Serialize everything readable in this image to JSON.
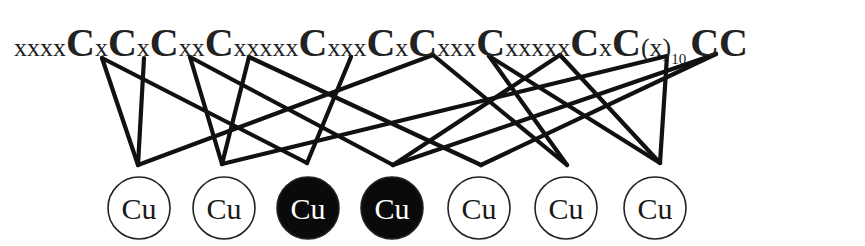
{
  "sequence": {
    "segments": [
      {
        "type": "spacer",
        "text": "xxxx"
      },
      {
        "type": "cys",
        "text": "C",
        "id": "C1"
      },
      {
        "type": "spacer",
        "text": "x"
      },
      {
        "type": "cys",
        "text": "C",
        "id": "C2"
      },
      {
        "type": "spacer",
        "text": "x"
      },
      {
        "type": "cys",
        "text": "C",
        "id": "C3"
      },
      {
        "type": "spacer",
        "text": "xx"
      },
      {
        "type": "cys",
        "text": "C",
        "id": "C4"
      },
      {
        "type": "spacer",
        "text": "xxxxx"
      },
      {
        "type": "cys",
        "text": "C",
        "id": "C5"
      },
      {
        "type": "spacer",
        "text": "xxx"
      },
      {
        "type": "cys",
        "text": "C",
        "id": "C6"
      },
      {
        "type": "spacer",
        "text": "x"
      },
      {
        "type": "cys",
        "text": "C",
        "id": "C7"
      },
      {
        "type": "spacer",
        "text": "xxx"
      },
      {
        "type": "cys",
        "text": "C",
        "id": "C8"
      },
      {
        "type": "spacer",
        "text": "xxxxx"
      },
      {
        "type": "cys",
        "text": "C",
        "id": "C9"
      },
      {
        "type": "spacer",
        "text": "x"
      },
      {
        "type": "cys",
        "text": "C",
        "id": "C10"
      },
      {
        "type": "spacer",
        "text": "(x)"
      },
      {
        "type": "subscript",
        "text": "10"
      },
      {
        "type": "cys",
        "text": "CC",
        "id": "C11-C12"
      }
    ]
  },
  "copper_ions": [
    {
      "id": "Cu1",
      "label": "Cu",
      "filled": false,
      "cx": 139,
      "cy": 208
    },
    {
      "id": "Cu2",
      "label": "Cu",
      "filled": false,
      "cx": 224,
      "cy": 208
    },
    {
      "id": "Cu3",
      "label": "Cu",
      "filled": true,
      "cx": 308,
      "cy": 208
    },
    {
      "id": "Cu4",
      "label": "Cu",
      "filled": true,
      "cx": 392,
      "cy": 208
    },
    {
      "id": "Cu5",
      "label": "Cu",
      "filled": false,
      "cx": 479,
      "cy": 208
    },
    {
      "id": "Cu6",
      "label": "Cu",
      "filled": false,
      "cx": 566,
      "cy": 208
    },
    {
      "id": "Cu7",
      "label": "Cu",
      "filled": false,
      "cx": 655,
      "cy": 208
    }
  ],
  "cysteine_anchors": {
    "C1": [
      102,
      58
    ],
    "C2": [
      144,
      58
    ],
    "C3": [
      190,
      57
    ],
    "C4": [
      249,
      57
    ],
    "C5": [
      351,
      57
    ],
    "C6": [
      433,
      55
    ],
    "C7": [
      489,
      56
    ],
    "C8": [
      560,
      55
    ],
    "C9": [
      667,
      56
    ],
    "C10": [
      716,
      54
    ]
  },
  "copper_anchors": {
    "Cu1": [
      138,
      165
    ],
    "Cu2": [
      222,
      164
    ],
    "Cu3": [
      307,
      163
    ],
    "Cu4": [
      393,
      165
    ],
    "Cu5": [
      481,
      165
    ],
    "Cu6": [
      567,
      165
    ],
    "Cu7": [
      660,
      163
    ]
  },
  "bonds": [
    [
      "C1",
      "Cu1"
    ],
    [
      "C1",
      "Cu3"
    ],
    [
      "C2",
      "Cu1"
    ],
    [
      "C3",
      "Cu2"
    ],
    [
      "C3",
      "Cu4"
    ],
    [
      "C4",
      "Cu2"
    ],
    [
      "C4",
      "Cu5"
    ],
    [
      "C5",
      "Cu3"
    ],
    [
      "C6",
      "Cu1"
    ],
    [
      "C6",
      "Cu6"
    ],
    [
      "C7",
      "Cu6"
    ],
    [
      "C7",
      "Cu7"
    ],
    [
      "C8",
      "Cu4"
    ],
    [
      "C8",
      "Cu7"
    ],
    [
      "C9",
      "Cu2"
    ],
    [
      "C9",
      "Cu7"
    ],
    [
      "C10",
      "Cu4"
    ],
    [
      "C10",
      "Cu5"
    ]
  ],
  "colors": {
    "line": "#111111",
    "text": "#222222",
    "filled_circle": "#0a0a0a",
    "filled_text": "#ffffff",
    "empty_circle": "#ffffff",
    "empty_text": "#1a1a1a"
  }
}
